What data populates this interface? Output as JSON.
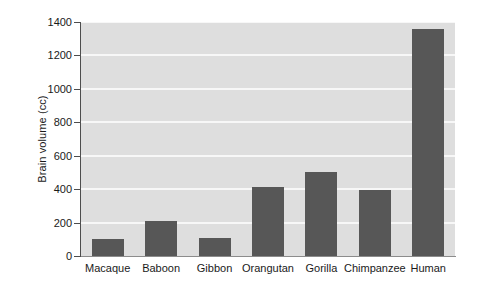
{
  "chart_data": {
    "type": "bar",
    "title": "",
    "xlabel": "",
    "ylabel": "Brain volume (cc)",
    "categories": [
      "Macaque",
      "Baboon",
      "Gibbon",
      "Orangutan",
      "Gorilla",
      "Chimpanzee",
      "Human"
    ],
    "values": [
      100,
      210,
      105,
      410,
      500,
      395,
      1360
    ],
    "ylim": [
      0,
      1400
    ],
    "yticks": [
      0,
      200,
      400,
      600,
      800,
      1000,
      1200,
      1400
    ],
    "ytick_labels": [
      "0",
      "200",
      "400",
      "600",
      "800",
      "1000",
      "1200",
      "1400"
    ],
    "grid": true,
    "grid_axis": "y",
    "legend": false,
    "legend_position": "none",
    "bar_color": "#575757",
    "plot_background": "#dedede",
    "gridline_color": "#f7f7f7",
    "figure_background": "#ffffff",
    "axis_color": "#4d4d4d",
    "text_color": "#1a1a1a"
  }
}
